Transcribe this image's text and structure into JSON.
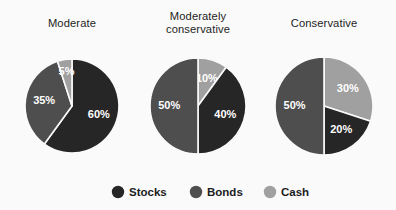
{
  "figure": {
    "background_color": "#fafafa",
    "label_color": "#ffffff",
    "title_color": "#1d1d1d"
  },
  "legend": {
    "position": "bottom",
    "entries": [
      {
        "label": "Stocks",
        "color": "#262626",
        "name": "stocks"
      },
      {
        "label": "Bonds",
        "color": "#4e4e4e",
        "name": "bonds"
      },
      {
        "label": "Cash",
        "color": "#a0a0a0",
        "name": "cash"
      }
    ]
  },
  "chart_data": {
    "type": "pie",
    "title": "",
    "subtitle": "",
    "xlabel": "",
    "ylabel": "",
    "legend_position": "bottom",
    "grid": false,
    "value_unit": "%",
    "categories": [
      "Stocks",
      "Bonds",
      "Cash"
    ],
    "colors": [
      "#262626",
      "#4e4e4e",
      "#a0a0a0"
    ],
    "charts": [
      {
        "title": "Moderate",
        "title_lines": [
          "Moderate"
        ],
        "cx": 72,
        "cy": 106,
        "r": 47,
        "start_angle_deg": 0,
        "slices": [
          {
            "category": "Stocks",
            "value": 60,
            "label": "60%",
            "color": "#262626"
          },
          {
            "category": "Bonds",
            "value": 35,
            "label": "35%",
            "color": "#4e4e4e"
          },
          {
            "category": "Cash",
            "value": 5,
            "label": "5%",
            "color": "#a0a0a0"
          }
        ]
      },
      {
        "title": "Moderately conservative",
        "title_lines": [
          "Moderately",
          "conservative"
        ],
        "cx": 198,
        "cy": 106,
        "r": 48,
        "start_angle_deg": 0,
        "slices": [
          {
            "category": "Cash",
            "value": 10,
            "label": "10%",
            "color": "#a0a0a0"
          },
          {
            "category": "Stocks",
            "value": 40,
            "label": "40%",
            "color": "#262626"
          },
          {
            "category": "Bonds",
            "value": 50,
            "label": "50%",
            "color": "#4e4e4e"
          }
        ]
      },
      {
        "title": "Conservative",
        "title_lines": [
          "Conservative"
        ],
        "cx": 324,
        "cy": 106,
        "r": 49,
        "start_angle_deg": 0,
        "slices": [
          {
            "category": "Cash",
            "value": 30,
            "label": "30%",
            "color": "#a0a0a0"
          },
          {
            "category": "Stocks",
            "value": 20,
            "label": "20%",
            "color": "#262626"
          },
          {
            "category": "Bonds",
            "value": 50,
            "label": "50%",
            "color": "#4e4e4e"
          }
        ]
      }
    ]
  }
}
